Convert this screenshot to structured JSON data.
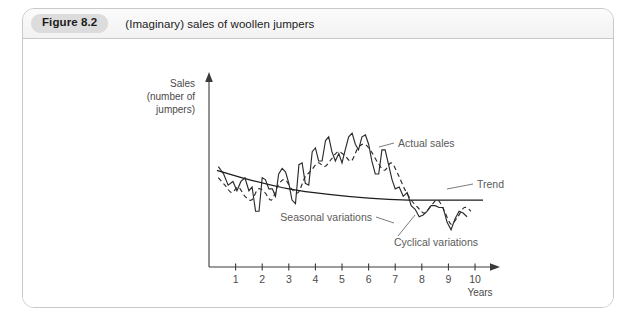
{
  "figure": {
    "badge_label": "Figure 8.2",
    "title": "(Imaginary) sales of woollen jumpers"
  },
  "chart_data": {
    "type": "line",
    "title": "(Imaginary) sales of woollen jumpers",
    "xlabel": "Years",
    "ylabel_lines": [
      "Sales",
      "(number of",
      "jumpers)"
    ],
    "ylabel": "Sales (number of jumpers)",
    "xlim": [
      0,
      10.6
    ],
    "ylim": [
      0,
      100
    ],
    "xticks": [
      "1",
      "2",
      "3",
      "4",
      "5",
      "6",
      "7",
      "8",
      "9",
      "10"
    ],
    "xtick_values": [
      1,
      2,
      3,
      4,
      5,
      6,
      7,
      8,
      9,
      10
    ],
    "yticks": [],
    "grid": false,
    "legend": "annotations",
    "axis_arrows": true,
    "annotations": [
      {
        "name": "actual-sales",
        "label": "Actual sales"
      },
      {
        "name": "trend",
        "label": "Trend"
      },
      {
        "name": "seasonal-variations",
        "label": "Seasonal variations"
      },
      {
        "name": "cyclical-variations",
        "label": "Cyclical variations"
      }
    ],
    "series": [
      {
        "name": "Actual sales",
        "style": "solid",
        "x": [
          0.35,
          0.55,
          0.72,
          0.9,
          1.05,
          1.2,
          1.35,
          1.5,
          1.62,
          1.75,
          1.88,
          2.0,
          2.12,
          2.25,
          2.38,
          2.5,
          2.62,
          2.75,
          2.88,
          3.0,
          3.12,
          3.25,
          3.38,
          3.5,
          3.62,
          3.75,
          3.88,
          4.0,
          4.12,
          4.25,
          4.38,
          4.5,
          4.62,
          4.75,
          4.88,
          5.0,
          5.12,
          5.25,
          5.38,
          5.5,
          5.62,
          5.75,
          5.88,
          6.0,
          6.12,
          6.25,
          6.38,
          6.5,
          6.62,
          6.75,
          6.88,
          7.0,
          7.15,
          7.3,
          7.45,
          7.6,
          7.75,
          7.9,
          8.05,
          8.2,
          8.35,
          8.5,
          8.65,
          8.8,
          8.95,
          9.1,
          9.25,
          9.4,
          9.55,
          9.7
        ],
        "y": [
          54,
          50,
          44,
          46,
          41,
          46,
          48,
          41,
          43,
          30,
          30,
          48,
          47,
          42,
          42,
          38,
          50,
          53,
          51,
          45,
          36,
          34,
          55,
          56,
          45,
          44,
          62,
          64,
          57,
          57,
          68,
          70,
          62,
          57,
          61,
          56,
          63,
          70,
          72,
          66,
          63,
          70,
          71,
          66,
          57,
          50,
          50,
          63,
          63,
          55,
          47,
          42,
          43,
          38,
          40,
          33,
          31,
          27,
          28,
          30,
          33,
          33,
          32,
          32,
          24,
          20,
          26,
          30,
          29,
          27
        ]
      },
      {
        "name": "Cyclical variations",
        "style": "dashed",
        "x": [
          0.35,
          0.6,
          0.85,
          1.1,
          1.35,
          1.6,
          1.85,
          2.1,
          2.35,
          2.6,
          2.85,
          3.1,
          3.35,
          3.6,
          3.85,
          4.1,
          4.35,
          4.6,
          4.85,
          5.1,
          5.35,
          5.6,
          5.85,
          6.1,
          6.35,
          6.6,
          6.85,
          7.1,
          7.35,
          7.6,
          7.85,
          8.1,
          8.35,
          8.6,
          8.85,
          9.1,
          9.35,
          9.6,
          9.85
        ],
        "y": [
          48,
          44,
          40,
          43,
          38,
          36,
          42,
          40,
          36,
          44,
          47,
          42,
          40,
          48,
          52,
          56,
          54,
          58,
          62,
          60,
          57,
          64,
          66,
          62,
          56,
          52,
          56,
          50,
          42,
          36,
          32,
          29,
          33,
          36,
          30,
          23,
          27,
          32,
          30
        ]
      },
      {
        "name": "Trend",
        "style": "smooth",
        "x": [
          0.3,
          1.5,
          3.0,
          4.5,
          6.0,
          7.5,
          9.0,
          10.3
        ],
        "y": [
          52,
          47,
          42,
          39,
          37,
          36,
          36,
          36
        ]
      }
    ]
  }
}
